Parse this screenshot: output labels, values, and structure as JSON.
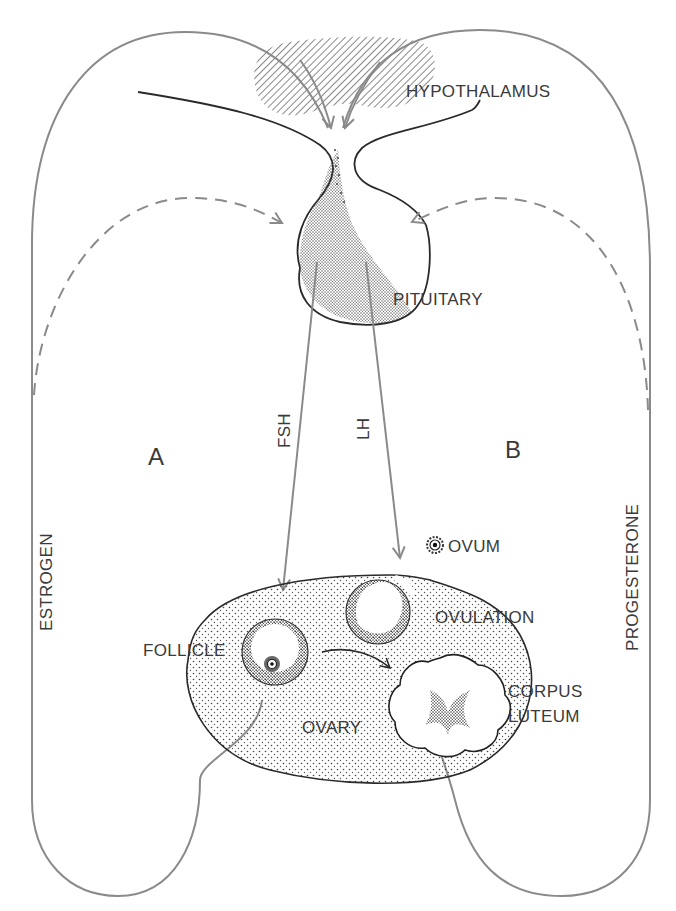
{
  "figure": {
    "labels": {
      "hypothalamus": "HYPOTHALAMUS",
      "pituitary": "PITUITARY",
      "fsh": "FSH",
      "lh": "LH",
      "loop_a": "A",
      "loop_b": "B",
      "estrogen": "ESTROGEN",
      "progesterone": "PROGESTERONE",
      "ovum": "OVUM",
      "ovulation": "OVULATION",
      "follicle": "FOLLICLE",
      "corpus": "CORPUS",
      "luteum": "LUTEUM",
      "ovary": "OVARY"
    },
    "colors": {
      "pathway_line": "#8a8a8a",
      "ink": "#2a2a2a",
      "text": "#3a3a3a",
      "background": "#ffffff"
    }
  }
}
